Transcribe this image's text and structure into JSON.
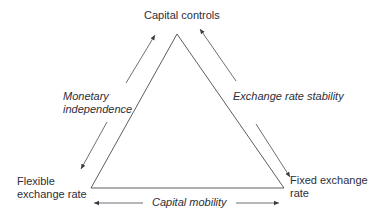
{
  "diagram": {
    "vertices": {
      "top": "Capital controls",
      "bottom_left": [
        "Flexible",
        "exchange rate"
      ],
      "bottom_right": [
        "Fixed exchange",
        "rate"
      ]
    },
    "sides": {
      "left": [
        "Monetary",
        "independence"
      ],
      "right": "Exchange rate stability",
      "bottom": "Capital mobility"
    },
    "colors": {
      "line": "#4a4a52",
      "text": "#2e2e38"
    }
  }
}
